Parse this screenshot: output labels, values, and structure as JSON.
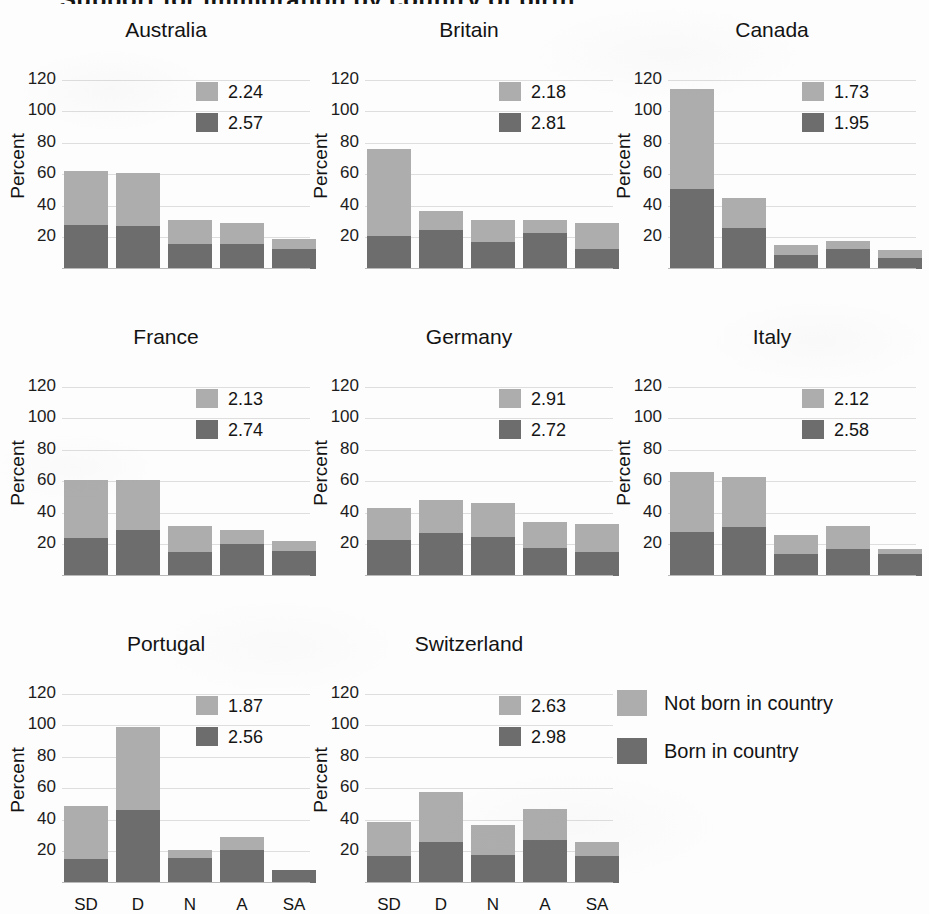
{
  "figure": {
    "clipped_title": "Support for immigration by country of birth",
    "ylabel": "Percent",
    "y_ticks": [
      "120",
      "100",
      "80",
      "60",
      "40",
      "20"
    ],
    "x_ticks": [
      "SD",
      "D",
      "N",
      "A",
      "SA"
    ],
    "colors": {
      "not_born": "#adadad",
      "born": "#6d6d6d",
      "gridline": "#dedede",
      "paper": "#fdfdfd"
    }
  },
  "legend": {
    "items": [
      {
        "label": "Not born in country",
        "color": "#adadad"
      },
      {
        "label": "Born in country",
        "color": "#6d6d6d"
      }
    ]
  },
  "chart_data": {
    "type": "bar",
    "title": "Support for immigration by country of birth",
    "xlabel": "",
    "ylabel": "Percent",
    "ylim": [
      0,
      130
    ],
    "yticks": [
      20,
      40,
      60,
      80,
      100,
      120
    ],
    "grid": true,
    "stacked": true,
    "legend_position": "bottom-right",
    "categories": [
      "SD",
      "D",
      "N",
      "A",
      "SA"
    ],
    "series_names": [
      "Not born in country",
      "Born in country"
    ],
    "panels": [
      {
        "name": "Australia",
        "means": {
          "not_born": "2.24",
          "born": "2.57"
        },
        "born": [
          28,
          27,
          16,
          16,
          13
        ],
        "not_born": [
          34,
          34,
          15,
          13,
          6
        ],
        "totals": [
          62,
          61,
          31,
          29,
          19
        ]
      },
      {
        "name": "Britain",
        "means": {
          "not_born": "2.18",
          "born": "2.81"
        },
        "born": [
          21,
          25,
          17,
          23,
          13
        ],
        "not_born": [
          55,
          12,
          14,
          8,
          16
        ],
        "totals": [
          76,
          37,
          31,
          31,
          29
        ]
      },
      {
        "name": "Canada",
        "means": {
          "not_born": "1.73",
          "born": "1.95"
        },
        "born": [
          51,
          26,
          9,
          13,
          7
        ],
        "not_born": [
          63,
          19,
          6,
          5,
          5
        ],
        "totals": [
          114,
          45,
          15,
          18,
          12
        ]
      },
      {
        "name": "France",
        "means": {
          "not_born": "2.13",
          "born": "2.74"
        },
        "born": [
          24,
          29,
          15,
          20,
          16
        ],
        "not_born": [
          37,
          32,
          17,
          9,
          6
        ],
        "totals": [
          61,
          61,
          32,
          29,
          22
        ]
      },
      {
        "name": "Germany",
        "means": {
          "not_born": "2.91",
          "born": "2.72"
        },
        "born": [
          23,
          27,
          25,
          18,
          15
        ],
        "not_born": [
          20,
          21,
          21,
          16,
          18
        ],
        "totals": [
          43,
          48,
          46,
          34,
          33
        ]
      },
      {
        "name": "Italy",
        "means": {
          "not_born": "2.12",
          "born": "2.58"
        },
        "born": [
          28,
          31,
          14,
          17,
          14
        ],
        "not_born": [
          38,
          32,
          12,
          15,
          3
        ],
        "totals": [
          66,
          63,
          26,
          32,
          17
        ]
      },
      {
        "name": "Portugal",
        "means": {
          "not_born": "1.87",
          "born": "2.56"
        },
        "born": [
          15,
          46,
          16,
          21,
          8
        ],
        "not_born": [
          34,
          53,
          5,
          8,
          0
        ],
        "totals": [
          49,
          99,
          21,
          29,
          8
        ]
      },
      {
        "name": "Switzerland",
        "means": {
          "not_born": "2.63",
          "born": "2.98"
        },
        "born": [
          17,
          26,
          18,
          27,
          17
        ],
        "not_born": [
          22,
          32,
          19,
          20,
          9
        ],
        "totals": [
          39,
          58,
          37,
          47,
          26
        ]
      }
    ]
  }
}
